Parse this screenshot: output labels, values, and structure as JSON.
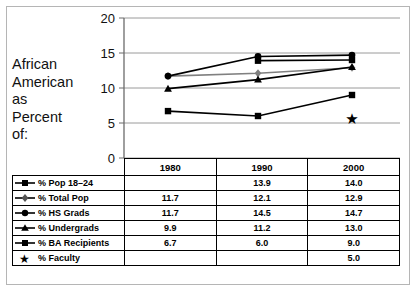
{
  "caption": {
    "lines": [
      "African",
      "American",
      "as",
      "Percent",
      "of:"
    ]
  },
  "chart_data": {
    "type": "line",
    "title": "African American as Percent of:",
    "xlabel": "",
    "ylabel": "",
    "categories": [
      "1980",
      "1990",
      "2000"
    ],
    "yticks": [
      0,
      5,
      10,
      15,
      20
    ],
    "ylim": [
      0,
      20
    ],
    "grid": true,
    "legend_position": "table-left",
    "annotations": [
      {
        "text": "*",
        "x": "2000",
        "y": 5.0,
        "series": "% Faculty"
      }
    ],
    "series": [
      {
        "name": "% Pop 18–24",
        "marker": "square",
        "color": "#000000",
        "values": [
          null,
          13.9,
          14.0
        ]
      },
      {
        "name": "% Total Pop",
        "marker": "diamond",
        "color": "#808080",
        "values": [
          11.7,
          12.1,
          12.9
        ]
      },
      {
        "name": "% HS Grads",
        "marker": "circle",
        "color": "#000000",
        "values": [
          11.7,
          14.5,
          14.7
        ]
      },
      {
        "name": "% Undergrads",
        "marker": "triangle",
        "color": "#000000",
        "values": [
          9.9,
          11.2,
          13.0
        ]
      },
      {
        "name": "% BA Recipients",
        "marker": "square",
        "color": "#000000",
        "values": [
          6.7,
          6.0,
          9.0
        ]
      },
      {
        "name": "% Faculty",
        "marker": "star",
        "color": "#000000",
        "values": [
          null,
          null,
          5.0
        ]
      }
    ]
  },
  "table": {
    "headers": [
      "",
      "1980",
      "1990",
      "2000"
    ],
    "rows": [
      {
        "label": "% Pop 18–24",
        "marker": "square",
        "cells": [
          "",
          "13.9",
          "14.0"
        ]
      },
      {
        "label": "% Total Pop",
        "marker": "diamond",
        "cells": [
          "11.7",
          "12.1",
          "12.9"
        ]
      },
      {
        "label": "% HS Grads",
        "marker": "circle",
        "cells": [
          "11.7",
          "14.5",
          "14.7"
        ]
      },
      {
        "label": "% Undergrads",
        "marker": "triangle",
        "cells": [
          "9.9",
          "11.2",
          "13.0"
        ]
      },
      {
        "label": "% BA Recipients",
        "marker": "square",
        "cells": [
          "6.7",
          "6.0",
          "9.0"
        ]
      },
      {
        "label": "% Faculty",
        "marker": "star",
        "cells": [
          "",
          "",
          "5.0"
        ]
      }
    ]
  },
  "colors": {
    "grid": "#9a9a9a",
    "axis": "#6b6b6b",
    "line_black": "#000000",
    "line_gray": "#808080",
    "border": "#b5b5b5"
  }
}
